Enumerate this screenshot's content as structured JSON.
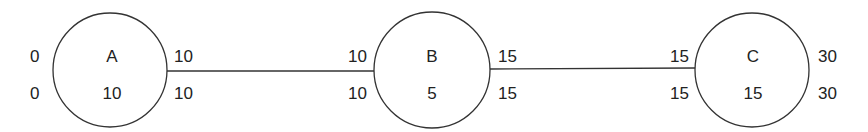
{
  "diagram": {
    "type": "network-schedule",
    "nodes": [
      {
        "id": "A",
        "label": "A",
        "duration": "10",
        "es": "0",
        "ls": "0",
        "ef": "10",
        "lf": "10"
      },
      {
        "id": "B",
        "label": "B",
        "duration": "5",
        "es": "10",
        "ls": "10",
        "ef": "15",
        "lf": "15"
      },
      {
        "id": "C",
        "label": "C",
        "duration": "15",
        "es": "15",
        "ls": "15",
        "ef": "30",
        "lf": "30"
      }
    ],
    "edges": [
      {
        "from": "A",
        "to": "B"
      },
      {
        "from": "B",
        "to": "C"
      }
    ],
    "colors": {
      "stroke": "#333333",
      "text": "#222222",
      "background": "#ffffff"
    }
  }
}
